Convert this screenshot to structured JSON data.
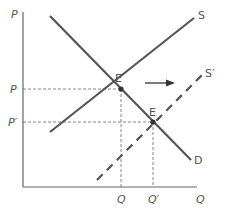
{
  "diagram": {
    "type": "supply-demand-shift",
    "axes": {
      "y_label": "P",
      "x_label": "Q"
    },
    "curves": {
      "supply": {
        "label": "S",
        "style": "solid"
      },
      "supply_shifted": {
        "label": "S′",
        "style": "dashed"
      },
      "demand": {
        "label": "D",
        "style": "solid"
      }
    },
    "equilibria": {
      "original": {
        "label": "E′",
        "price_label": "P",
        "quantity_label": "Q"
      },
      "new": {
        "label": "E",
        "price_label": "P′",
        "quantity_label": "Q′"
      }
    },
    "shift_arrow": {
      "direction": "right"
    },
    "colors": {
      "curve": "#555555",
      "axis": "#666666",
      "guide": "#777777",
      "text": "#555555"
    }
  }
}
